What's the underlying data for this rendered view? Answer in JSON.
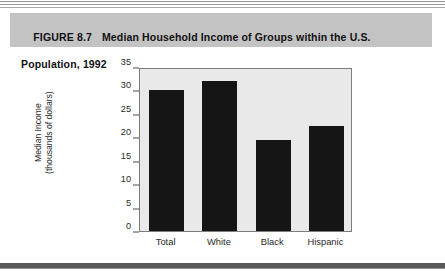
{
  "figure": {
    "number_label": "FIGURE 8.7",
    "title_line1": "Median Household Income of Groups within the U.S.",
    "title_line2": "Population, 1992",
    "band_color": "#c3c3c3"
  },
  "chart_data": {
    "type": "bar",
    "title": "Median Household Income of Groups within the U.S. Population, 1992",
    "categories": [
      "Total",
      "White",
      "Black",
      "Hispanic"
    ],
    "values": [
      30.2,
      32.0,
      19.5,
      22.5
    ],
    "xlabel": "",
    "ylabel": "Median Income (thousands of dollars)",
    "ylabel_line1": "Median Income",
    "ylabel_line2": "(thousands of dollars)",
    "ylim": [
      0,
      35
    ],
    "yticks": [
      0,
      5,
      10,
      15,
      20,
      25,
      30,
      35
    ],
    "ytick_labels": [
      "0",
      "5",
      "10",
      "15",
      "20",
      "25",
      "30",
      "35"
    ],
    "grid": false,
    "legend": false,
    "bar_color": "#151515",
    "plot_background": "#e9e9e9",
    "axis_color": "#7d7d7d"
  }
}
